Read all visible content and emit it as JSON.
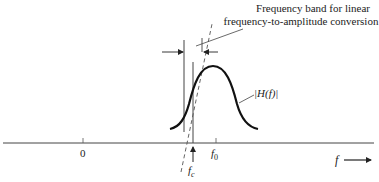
{
  "diagram": {
    "annotation": {
      "line1": "Frequency band for linear",
      "line2": "frequency-to-amplitude conversion"
    },
    "curve_label": "|H(f)|",
    "axis": {
      "variable_label": "f",
      "zero_label": "0",
      "f0_label": "f",
      "f0_sub": "0",
      "fc_label": "f",
      "fc_sub": "c"
    },
    "colors": {
      "stroke": "#222222",
      "curve": "#111111",
      "background": "#ffffff"
    }
  }
}
